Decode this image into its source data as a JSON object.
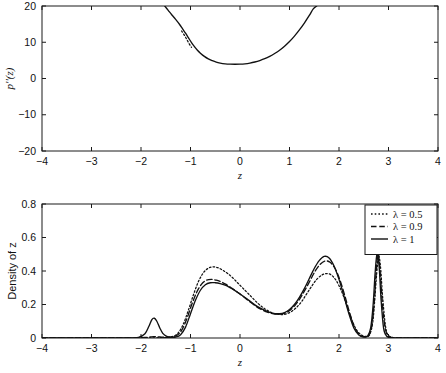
{
  "figure": {
    "background": "#ffffff",
    "line_color": "#111111"
  },
  "chart_data": [
    {
      "id": "top",
      "type": "line",
      "title": "",
      "xlabel": "z",
      "ylabel": "p''(z)",
      "xlim": [
        -4,
        4
      ],
      "ylim": [
        -20,
        20
      ],
      "xticks": [
        -4,
        -3,
        -2,
        -1,
        0,
        1,
        2,
        3,
        4
      ],
      "xticklabels": [
        "-4",
        "-3",
        "-2",
        "-1",
        "0",
        "1",
        "2",
        "3",
        "4"
      ],
      "yticks": [
        -20,
        -10,
        0,
        10,
        20
      ],
      "yticklabels": [
        "-20",
        "-10",
        "0",
        "10",
        "20"
      ],
      "grid": false,
      "legend": "none",
      "series": [
        {
          "name": "p''(z)",
          "style": "solid",
          "x": [
            -1.52,
            -1.45,
            -1.38,
            -1.3,
            -1.22,
            -1.16,
            -1.1,
            -1.04,
            -0.98,
            -0.92,
            -0.86,
            -0.8,
            -0.72,
            -0.64,
            -0.56,
            -0.48,
            -0.4,
            -0.3,
            -0.2,
            -0.1,
            0.0,
            0.1,
            0.2,
            0.3,
            0.4,
            0.5,
            0.6,
            0.7,
            0.8,
            0.9,
            1.0,
            1.1,
            1.2,
            1.3,
            1.4,
            1.48,
            1.55
          ],
          "y": [
            20.0,
            18.8,
            17.6,
            16.3,
            14.9,
            13.7,
            12.5,
            11.2,
            9.9,
            8.8,
            7.8,
            7.0,
            6.1,
            5.4,
            4.9,
            4.5,
            4.25,
            4.05,
            3.95,
            3.92,
            3.95,
            4.05,
            4.25,
            4.55,
            4.95,
            5.45,
            6.1,
            6.9,
            7.8,
            8.9,
            10.2,
            11.7,
            13.4,
            15.3,
            17.4,
            19.2,
            20.0
          ]
        },
        {
          "name": "p''(z) branch",
          "style": "dotted",
          "x": [
            -1.18,
            -1.14,
            -1.1,
            -1.06,
            -1.02,
            -0.98
          ],
          "y": [
            13.1,
            12.3,
            11.4,
            10.4,
            9.4,
            8.6
          ]
        }
      ]
    },
    {
      "id": "bottom",
      "type": "line",
      "title": "",
      "xlabel": "z",
      "ylabel": "Density of z",
      "xlim": [
        -4,
        4
      ],
      "ylim": [
        0,
        0.8
      ],
      "xticks": [
        -4,
        -3,
        -2,
        -1,
        0,
        1,
        2,
        3,
        4
      ],
      "xticklabels": [
        "-4",
        "-3",
        "-2",
        "-1",
        "0",
        "1",
        "2",
        "3",
        "4"
      ],
      "yticks": [
        0,
        0.2,
        0.4,
        0.6,
        0.8
      ],
      "yticklabels": [
        "0",
        "0.2",
        "0.4",
        "0.6",
        "0.8"
      ],
      "grid": false,
      "legend": "upper right",
      "legend_entries": [
        {
          "label": "λ = 0.5",
          "style": "dotted"
        },
        {
          "label": "λ = 0.9",
          "style": "dashed"
        },
        {
          "label": "λ = 1",
          "style": "solid"
        }
      ],
      "series": [
        {
          "name": "λ = 0.5",
          "style": "dotted",
          "x": [
            -4.0,
            -3.0,
            -2.4,
            -2.1,
            -1.9,
            -1.75,
            -1.6,
            -1.45,
            -1.35,
            -1.25,
            -1.15,
            -1.05,
            -0.95,
            -0.85,
            -0.75,
            -0.65,
            -0.55,
            -0.45,
            -0.35,
            -0.25,
            -0.15,
            -0.05,
            0.05,
            0.15,
            0.25,
            0.35,
            0.45,
            0.55,
            0.65,
            0.75,
            0.85,
            0.95,
            1.05,
            1.15,
            1.25,
            1.35,
            1.45,
            1.55,
            1.65,
            1.75,
            1.85,
            1.95,
            2.05,
            2.15,
            2.25,
            2.35,
            2.45,
            2.55,
            2.62,
            2.68,
            2.72,
            2.76,
            2.8,
            2.84,
            2.88,
            2.94,
            3.0,
            3.1,
            3.3,
            3.6,
            4.0
          ],
          "y": [
            0.0,
            0.0,
            0.0,
            0.0,
            0.0,
            0.001,
            0.002,
            0.004,
            0.01,
            0.03,
            0.08,
            0.16,
            0.25,
            0.33,
            0.385,
            0.415,
            0.425,
            0.42,
            0.405,
            0.385,
            0.36,
            0.33,
            0.3,
            0.27,
            0.24,
            0.21,
            0.185,
            0.165,
            0.15,
            0.142,
            0.14,
            0.145,
            0.16,
            0.185,
            0.22,
            0.265,
            0.31,
            0.35,
            0.375,
            0.385,
            0.375,
            0.34,
            0.28,
            0.2,
            0.115,
            0.05,
            0.018,
            0.01,
            0.02,
            0.09,
            0.22,
            0.38,
            0.49,
            0.42,
            0.25,
            0.07,
            0.015,
            0.003,
            0.0,
            0.0,
            0.0
          ]
        },
        {
          "name": "λ = 0.9",
          "style": "dashed",
          "x": [
            -4.0,
            -3.0,
            -2.4,
            -2.1,
            -1.92,
            -1.82,
            -1.74,
            -1.66,
            -1.58,
            -1.48,
            -1.38,
            -1.28,
            -1.18,
            -1.08,
            -0.98,
            -0.88,
            -0.78,
            -0.68,
            -0.58,
            -0.48,
            -0.38,
            -0.28,
            -0.18,
            -0.08,
            0.02,
            0.12,
            0.22,
            0.32,
            0.42,
            0.52,
            0.62,
            0.72,
            0.82,
            0.92,
            1.02,
            1.12,
            1.22,
            1.32,
            1.42,
            1.52,
            1.62,
            1.72,
            1.82,
            1.92,
            2.02,
            2.12,
            2.22,
            2.32,
            2.42,
            2.52,
            2.6,
            2.66,
            2.71,
            2.75,
            2.79,
            2.83,
            2.88,
            2.94,
            3.02,
            3.2,
            3.6,
            4.0
          ],
          "y": [
            0.0,
            0.0,
            0.0,
            0.001,
            0.003,
            0.006,
            0.008,
            0.007,
            0.005,
            0.004,
            0.006,
            0.015,
            0.045,
            0.11,
            0.195,
            0.27,
            0.32,
            0.345,
            0.35,
            0.345,
            0.335,
            0.32,
            0.3,
            0.28,
            0.258,
            0.235,
            0.212,
            0.19,
            0.172,
            0.158,
            0.148,
            0.143,
            0.143,
            0.15,
            0.168,
            0.198,
            0.24,
            0.29,
            0.345,
            0.4,
            0.44,
            0.46,
            0.452,
            0.415,
            0.345,
            0.25,
            0.145,
            0.06,
            0.018,
            0.008,
            0.015,
            0.07,
            0.21,
            0.39,
            0.5,
            0.4,
            0.19,
            0.05,
            0.008,
            0.0,
            0.0,
            0.0
          ]
        },
        {
          "name": "λ = 1",
          "style": "solid",
          "x": [
            -4.0,
            -3.0,
            -2.3,
            -2.05,
            -1.92,
            -1.84,
            -1.78,
            -1.73,
            -1.68,
            -1.62,
            -1.56,
            -1.48,
            -1.4,
            -1.3,
            -1.2,
            -1.1,
            -1.0,
            -0.9,
            -0.8,
            -0.7,
            -0.6,
            -0.5,
            -0.4,
            -0.3,
            -0.2,
            -0.1,
            0.0,
            0.1,
            0.2,
            0.3,
            0.4,
            0.5,
            0.6,
            0.7,
            0.8,
            0.9,
            1.0,
            1.1,
            1.2,
            1.3,
            1.4,
            1.5,
            1.6,
            1.7,
            1.8,
            1.9,
            2.0,
            2.1,
            2.2,
            2.3,
            2.4,
            2.5,
            2.58,
            2.64,
            2.69,
            2.73,
            2.77,
            2.81,
            2.85,
            2.9,
            2.96,
            3.05,
            3.3,
            3.7,
            4.0
          ],
          "y": [
            0.0,
            0.0,
            0.0,
            0.004,
            0.025,
            0.07,
            0.11,
            0.118,
            0.1,
            0.06,
            0.028,
            0.01,
            0.005,
            0.006,
            0.02,
            0.065,
            0.145,
            0.225,
            0.285,
            0.318,
            0.33,
            0.33,
            0.325,
            0.315,
            0.3,
            0.283,
            0.263,
            0.242,
            0.22,
            0.198,
            0.18,
            0.165,
            0.153,
            0.146,
            0.145,
            0.152,
            0.17,
            0.2,
            0.243,
            0.295,
            0.355,
            0.415,
            0.462,
            0.487,
            0.478,
            0.43,
            0.35,
            0.25,
            0.145,
            0.06,
            0.018,
            0.006,
            0.012,
            0.06,
            0.2,
            0.39,
            0.505,
            0.43,
            0.23,
            0.06,
            0.012,
            0.002,
            0.0,
            0.0,
            0.0
          ]
        }
      ]
    }
  ]
}
